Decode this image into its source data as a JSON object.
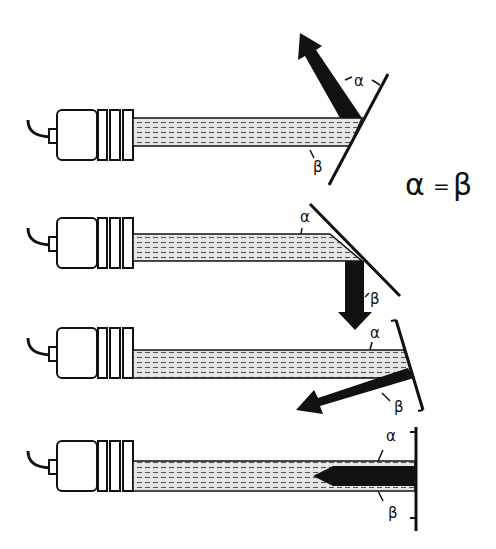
{
  "diagram": {
    "equation": {
      "alpha": "α",
      "equals": "=",
      "beta": "β"
    },
    "colors": {
      "ink": "#111111",
      "beam_fill": "#d8d8d8",
      "background": "#ffffff"
    },
    "rows": [
      {
        "id": "row-1",
        "reflector": "tilted-up",
        "reflected_direction": "up-left",
        "angle_labels": {
          "alpha": "α",
          "beta": "β"
        }
      },
      {
        "id": "row-2",
        "reflector": "tilted-down",
        "reflected_direction": "down",
        "angle_labels": {
          "alpha": "α",
          "beta": "β"
        }
      },
      {
        "id": "row-3",
        "reflector": "slightly-tilted",
        "reflected_direction": "down-left",
        "angle_labels": {
          "alpha": "α",
          "beta": "β"
        }
      },
      {
        "id": "row-4",
        "reflector": "perpendicular",
        "reflected_direction": "back-to-sensor",
        "angle_labels": {
          "alpha": "α",
          "beta": "β"
        }
      }
    ]
  }
}
